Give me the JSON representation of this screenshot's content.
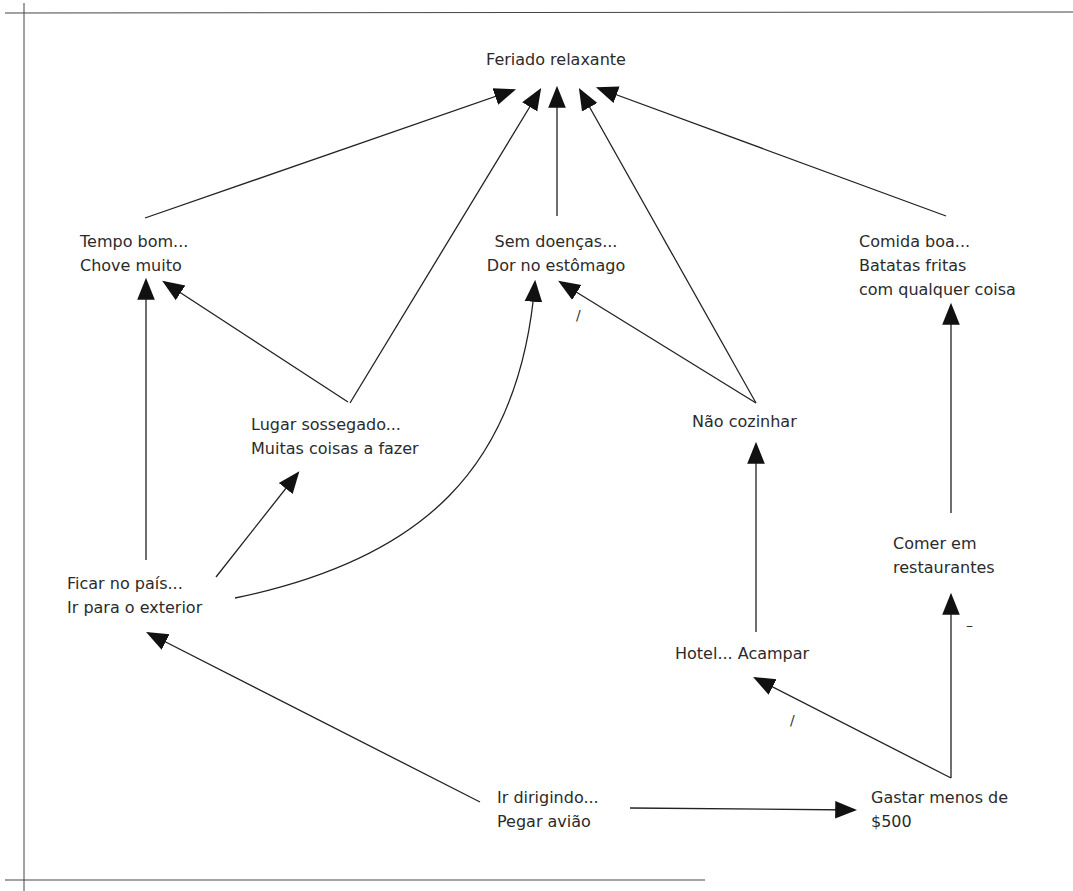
{
  "diagram": {
    "title": "Feriado relaxante",
    "nodes": {
      "feriado": {
        "lines": [
          "Feriado relaxante"
        ]
      },
      "tempo": {
        "lines": [
          "Tempo bom...",
          "Chove muito"
        ]
      },
      "doencas": {
        "lines": [
          "Sem doenças...",
          "Dor no estômago"
        ]
      },
      "comida": {
        "lines": [
          "Comida boa...",
          "Batatas fritas",
          "com qualquer coisa"
        ]
      },
      "lugar": {
        "lines": [
          "Lugar sossegado...",
          "Muitas coisas a fazer"
        ]
      },
      "cozinhar": {
        "lines": [
          "Não cozinhar"
        ]
      },
      "pais": {
        "lines": [
          "Ficar no país...",
          "Ir para o exterior"
        ]
      },
      "restaurantes": {
        "lines": [
          "Comer em",
          "restaurantes"
        ]
      },
      "hotel": {
        "lines": [
          "Hotel... Acampar"
        ]
      },
      "dirigindo": {
        "lines": [
          "Ir dirigindo...",
          "Pegar avião"
        ]
      },
      "gastar": {
        "lines": [
          "Gastar menos de",
          "$500"
        ]
      }
    },
    "edges": [
      {
        "from": "tempo",
        "to": "feriado",
        "polarity": ""
      },
      {
        "from": "lugar",
        "to": "feriado",
        "polarity": ""
      },
      {
        "from": "doencas",
        "to": "feriado",
        "polarity": ""
      },
      {
        "from": "cozinhar",
        "to": "feriado",
        "polarity": ""
      },
      {
        "from": "comida",
        "to": "feriado",
        "polarity": ""
      },
      {
        "from": "pais",
        "to": "tempo",
        "polarity": ""
      },
      {
        "from": "lugar",
        "to": "tempo",
        "polarity": ""
      },
      {
        "from": "pais",
        "to": "lugar",
        "polarity": ""
      },
      {
        "from": "pais",
        "to": "doencas",
        "polarity": ""
      },
      {
        "from": "cozinhar",
        "to": "doencas",
        "polarity": "/"
      },
      {
        "from": "hotel",
        "to": "cozinhar",
        "polarity": ""
      },
      {
        "from": "restaurantes",
        "to": "comida",
        "polarity": ""
      },
      {
        "from": "gastar",
        "to": "restaurantes",
        "polarity": "–"
      },
      {
        "from": "gastar",
        "to": "hotel",
        "polarity": "/"
      },
      {
        "from": "dirigindo",
        "to": "pais",
        "polarity": ""
      },
      {
        "from": "dirigindo",
        "to": "gastar",
        "polarity": ""
      }
    ],
    "marks": {
      "doencas_slash": "/",
      "hotel_slash": "/",
      "restaurantes_dash": "–"
    }
  }
}
